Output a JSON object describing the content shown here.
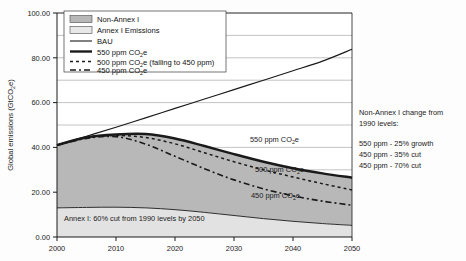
{
  "chart_data": {
    "type": "area",
    "title": "",
    "xlabel": "",
    "ylabel": "Global emissions (GtCO2e)",
    "ylabel_parts": {
      "pre": "Global emissions (GtCO",
      "sub": "2",
      "post": "e)"
    },
    "xlim": [
      2000,
      2050
    ],
    "ylim": [
      0,
      100
    ],
    "yticks": [
      0.0,
      20.0,
      40.0,
      60.0,
      80.0,
      100.0
    ],
    "ytick_labels": [
      "0.00",
      "20.00",
      "40.00",
      "60.00",
      "80.00",
      "100.00"
    ],
    "xticks": [
      2000,
      2010,
      2020,
      2030,
      2040,
      2050
    ],
    "xtick_labels": [
      "2000",
      "2010",
      "2020",
      "2030",
      "2040",
      "2050"
    ],
    "gridlines": {
      "minor_step": 10,
      "major_step": 20,
      "visible": true
    },
    "legend_position": "top-left-inside",
    "x": [
      2000,
      2005,
      2010,
      2015,
      2020,
      2025,
      2030,
      2035,
      2040,
      2045,
      2050
    ],
    "series": [
      {
        "name": "Annex I Emissions",
        "kind": "area-band",
        "values": [
          13.0,
          13.2,
          13.3,
          13.0,
          12.2,
          11.0,
          9.6,
          8.2,
          7.0,
          6.0,
          5.2
        ]
      },
      {
        "name": "Non-Annex I",
        "kind": "area-band",
        "values": [
          28.0,
          31.3,
          32.5,
          33.0,
          31.8,
          29.6,
          27.4,
          25.4,
          23.7,
          22.4,
          21.3
        ]
      },
      {
        "name": "BAU",
        "kind": "line-thin",
        "values": [
          41.0,
          45.0,
          49.0,
          53.2,
          57.4,
          61.6,
          65.8,
          70.0,
          74.2,
          78.5,
          83.8
        ]
      },
      {
        "name": "550 ppm CO2e",
        "kind": "line-thick",
        "values": [
          41.0,
          44.5,
          45.8,
          46.0,
          44.0,
          40.6,
          37.0,
          33.6,
          30.7,
          28.4,
          26.5
        ]
      },
      {
        "name": "500 ppm CO2e (falling to 450 ppm)",
        "kind": "line-dotted",
        "values": [
          41.0,
          44.3,
          45.3,
          44.4,
          41.6,
          37.6,
          33.6,
          30.0,
          26.8,
          23.8,
          21.0
        ]
      },
      {
        "name": "450 ppm CO2e",
        "kind": "line-dashdot",
        "values": [
          41.0,
          44.0,
          44.8,
          41.5,
          36.0,
          30.5,
          25.5,
          21.5,
          18.4,
          16.0,
          14.2
        ]
      }
    ],
    "legend": [
      {
        "label": "Non-Annex I",
        "marker": "swatch-dark"
      },
      {
        "label": "Annex I Emissions",
        "marker": "swatch-light"
      },
      {
        "label": "BAU",
        "marker": "line-thin"
      },
      {
        "label": "550 ppm CO2e",
        "marker": "line-thick",
        "pre": "550 ppm CO",
        "sub": "2",
        "post": "e"
      },
      {
        "label": "500 ppm CO2e (falling to 450 ppm)",
        "marker": "line-dotted",
        "pre": "500 ppm CO",
        "sub": "2",
        "post": "e (falling to 450 ppm)"
      },
      {
        "label": "450 ppm CO2e",
        "marker": "line-dashdot",
        "pre": "450 ppm CO",
        "sub": "2",
        "post": "e"
      }
    ],
    "annotations": [
      {
        "id": "label-550",
        "pre": "550 ppm CO",
        "sub": "2",
        "post": "e"
      },
      {
        "id": "label-500",
        "pre": "500 ppm CO",
        "sub": "2",
        "post": "e"
      },
      {
        "id": "label-450",
        "pre": "450 ppm CO",
        "sub": "2",
        "post": "e"
      },
      {
        "id": "annex-note",
        "text": "Annex I: 60% cut from 1990 levels by 2050"
      }
    ],
    "side_note": {
      "heading_line1": "Non-Annex I change from",
      "heading_line2": "1990 levels:",
      "rows": [
        "550 ppm - 25% growth",
        "450 ppm - 35% cut",
        "450 ppm - 70% cut"
      ]
    },
    "colors": {
      "non_annex_fill": "#b8b8b8",
      "annex_fill": "#e2e2e2",
      "line": "#1a1a1a",
      "grid": "#9a9a9a",
      "plot_bg": "#ffffff"
    }
  }
}
